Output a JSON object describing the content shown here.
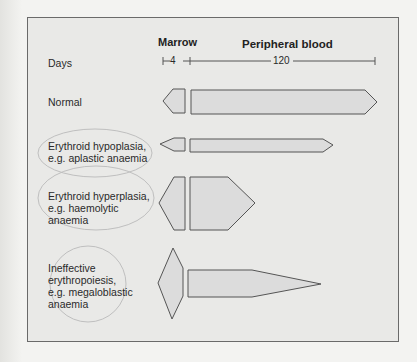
{
  "headers": {
    "marrow": "Marrow",
    "peripheral": "Peripheral blood"
  },
  "days": {
    "label": "Days",
    "marrow_days": "4",
    "blood_days": "120"
  },
  "rows": [
    {
      "label_line1": "Normal",
      "label_line2": "",
      "label_line3": "",
      "label_line4": ""
    },
    {
      "label_line1": "Erythroid hypoplasia,",
      "label_line2": "e.g. aplastic anaemia",
      "label_line3": "",
      "label_line4": ""
    },
    {
      "label_line1": "Erythroid hyperplasia,",
      "label_line2": "e.g. haemolytic",
      "label_line3": "anaemia",
      "label_line4": ""
    },
    {
      "label_line1": "Ineffective",
      "label_line2": "erythropoiesis,",
      "label_line3": "e.g. megaloblastic",
      "label_line4": "anaemia"
    }
  ],
  "colors": {
    "fill": "#dcdcdc",
    "stroke": "#555555",
    "panel": "#e9e9e7"
  }
}
